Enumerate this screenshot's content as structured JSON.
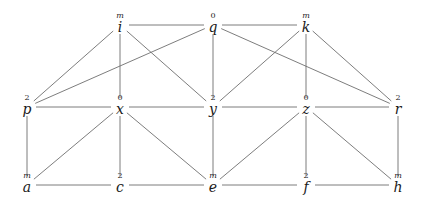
{
  "diagram": {
    "type": "graph",
    "directed": false,
    "nodes": [
      {
        "id": "i",
        "label": "i",
        "annotation": "m",
        "x": 120,
        "y": 25
      },
      {
        "id": "q",
        "label": "q",
        "annotation": "0",
        "x": 213,
        "y": 25
      },
      {
        "id": "k",
        "label": "k",
        "annotation": "m",
        "x": 306,
        "y": 25
      },
      {
        "id": "p",
        "label": "p",
        "annotation": "2",
        "x": 27,
        "y": 107
      },
      {
        "id": "x",
        "label": "x",
        "annotation": "0",
        "x": 120,
        "y": 107
      },
      {
        "id": "y",
        "label": "y",
        "annotation": "2",
        "x": 213,
        "y": 107
      },
      {
        "id": "z",
        "label": "z",
        "annotation": "0",
        "x": 306,
        "y": 107
      },
      {
        "id": "r",
        "label": "r",
        "annotation": "2",
        "x": 398,
        "y": 107
      },
      {
        "id": "a",
        "label": "a",
        "annotation": "m",
        "x": 27,
        "y": 185
      },
      {
        "id": "c",
        "label": "c",
        "annotation": "2",
        "x": 120,
        "y": 185
      },
      {
        "id": "e",
        "label": "e",
        "annotation": "m",
        "x": 213,
        "y": 185
      },
      {
        "id": "f",
        "label": "f",
        "annotation": "2",
        "x": 306,
        "y": 185
      },
      {
        "id": "h",
        "label": "h",
        "annotation": "m",
        "x": 398,
        "y": 185
      }
    ],
    "edges": [
      [
        "i",
        "q"
      ],
      [
        "q",
        "k"
      ],
      [
        "i",
        "p"
      ],
      [
        "i",
        "x"
      ],
      [
        "i",
        "y"
      ],
      [
        "q",
        "p"
      ],
      [
        "q",
        "y"
      ],
      [
        "q",
        "r"
      ],
      [
        "k",
        "y"
      ],
      [
        "k",
        "z"
      ],
      [
        "k",
        "r"
      ],
      [
        "p",
        "x"
      ],
      [
        "x",
        "y"
      ],
      [
        "y",
        "z"
      ],
      [
        "z",
        "r"
      ],
      [
        "p",
        "a"
      ],
      [
        "x",
        "a"
      ],
      [
        "x",
        "c"
      ],
      [
        "x",
        "e"
      ],
      [
        "y",
        "e"
      ],
      [
        "z",
        "e"
      ],
      [
        "z",
        "f"
      ],
      [
        "z",
        "h"
      ],
      [
        "r",
        "h"
      ],
      [
        "a",
        "c"
      ],
      [
        "c",
        "e"
      ],
      [
        "e",
        "f"
      ],
      [
        "f",
        "h"
      ]
    ],
    "edge_color": "#6e6e6e"
  }
}
